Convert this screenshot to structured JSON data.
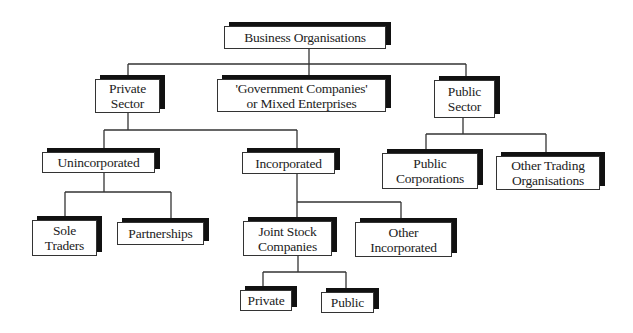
{
  "diagram": {
    "title": "Business Organisations",
    "nodes": {
      "root": "Business Organisations",
      "private_sector": "Private\nSector",
      "government_companies": "'Government Companies'\nor Mixed Enterprises",
      "public_sector": "Public\nSector",
      "unincorporated": "Unincorporated",
      "incorporated": "Incorporated",
      "public_corporations": "Public\nCorporations",
      "other_trading": "Other Trading\nOrganisations",
      "sole_traders": "Sole\nTraders",
      "partnerships": "Partnerships",
      "joint_stock": "Joint Stock\nCompanies",
      "other_incorporated": "Other\nIncorporated",
      "jsc_private": "Private",
      "jsc_public": "Public"
    },
    "edges": [
      [
        "root",
        "private_sector"
      ],
      [
        "root",
        "government_companies"
      ],
      [
        "root",
        "public_sector"
      ],
      [
        "private_sector",
        "unincorporated"
      ],
      [
        "private_sector",
        "incorporated"
      ],
      [
        "public_sector",
        "public_corporations"
      ],
      [
        "public_sector",
        "other_trading"
      ],
      [
        "unincorporated",
        "sole_traders"
      ],
      [
        "unincorporated",
        "partnerships"
      ],
      [
        "incorporated",
        "joint_stock"
      ],
      [
        "incorporated",
        "other_incorporated"
      ],
      [
        "joint_stock",
        "jsc_private"
      ],
      [
        "joint_stock",
        "jsc_public"
      ]
    ]
  }
}
